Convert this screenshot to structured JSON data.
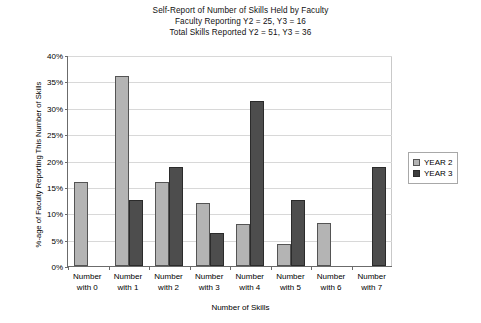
{
  "title": {
    "line1": "Self-Report of Number of Skills Held by Faculty",
    "line2": "Faculty Reporting Y2 = 25, Y3 = 16",
    "line3": "Total Skills Reported Y2 = 51, Y3 = 36"
  },
  "axes": {
    "y_title": "%-age of Faculty Reporting This Number of Skills",
    "x_title": "Number of Skills",
    "y_ticks": [
      "40%",
      "35%",
      "30%",
      "25%",
      "20%",
      "15%",
      "10%",
      "5%",
      "0%"
    ]
  },
  "legend": {
    "items": [
      {
        "label": "YEAR 2",
        "color": "#b4b4b4"
      },
      {
        "label": "YEAR 3",
        "color": "#3d3d3d"
      }
    ]
  },
  "chart_data": {
    "type": "bar",
    "title": "Self-Report of Number of Skills Held by Faculty",
    "subtitle": "Faculty Reporting Y2 = 25, Y3 = 16 / Total Skills Reported Y2 = 51, Y3 = 36",
    "xlabel": "Number of Skills",
    "ylabel": "%-age of Faculty Reporting This Number of Skills",
    "ylim": [
      0,
      40
    ],
    "ytick_step": 5,
    "ytick_format": "percent",
    "grid": true,
    "legend_position": "right",
    "categories": [
      "Number with 0",
      "Number with 1",
      "Number with 2",
      "Number with 3",
      "Number with 4",
      "Number with 5",
      "Number with 6",
      "Number with 7"
    ],
    "category_lines": [
      [
        "Number",
        "with 0"
      ],
      [
        "Number",
        "with 1"
      ],
      [
        "Number",
        "with 2"
      ],
      [
        "Number",
        "with 3"
      ],
      [
        "Number",
        "with 4"
      ],
      [
        "Number",
        "with 5"
      ],
      [
        "Number",
        "with 6"
      ],
      [
        "Number",
        "with 7"
      ]
    ],
    "series": [
      {
        "name": "YEAR 2",
        "color": "#b4b4b4",
        "values": [
          16,
          36,
          16,
          12,
          8,
          4.2,
          8.2,
          0
        ]
      },
      {
        "name": "YEAR 3",
        "color": "#3d3d3d",
        "values": [
          0,
          12.5,
          18.8,
          6.3,
          31.3,
          12.5,
          0,
          18.8
        ]
      }
    ]
  }
}
